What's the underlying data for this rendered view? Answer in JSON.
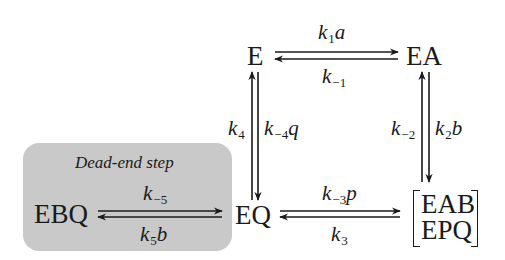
{
  "diagram": {
    "nodes": {
      "E": "E",
      "EA": "EA",
      "EQ": "EQ",
      "EBQ": "EBQ",
      "ternary_top": "EAB",
      "ternary_bottom": "EPQ"
    },
    "dead_end": {
      "label": "Dead-end step",
      "fill_color": "#c9c9c9"
    },
    "rates": {
      "top_forward": {
        "k": "k",
        "sub": "1",
        "suffix": "a"
      },
      "top_backward": {
        "k": "k",
        "sub": "−1",
        "suffix": ""
      },
      "right_up": {
        "k": "k",
        "sub": "−2",
        "suffix": ""
      },
      "right_down": {
        "k": "k",
        "sub": "2",
        "suffix": "b"
      },
      "bottom_forward": {
        "k": "k",
        "sub": "−3",
        "suffix": "p"
      },
      "bottom_backward": {
        "k": "k",
        "sub": "3",
        "suffix": ""
      },
      "left_up": {
        "k": "k",
        "sub": "4",
        "suffix": ""
      },
      "left_down": {
        "k": "k",
        "sub": "−4",
        "suffix": "q"
      },
      "dead_forward": {
        "k": "k",
        "sub": "−5",
        "suffix": ""
      },
      "dead_backward": {
        "k": "k",
        "sub": "5",
        "suffix": "b"
      }
    },
    "colors": {
      "ink": "#1a1a1a",
      "background": "#ffffff"
    }
  }
}
